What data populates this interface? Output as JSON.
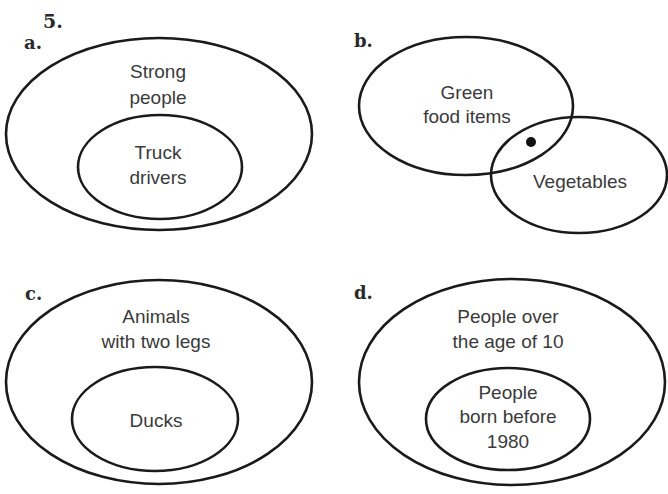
{
  "question": {
    "number": "5."
  },
  "colors": {
    "stroke": "#1a1a1a",
    "text": "#3a3a3a",
    "background": "#ffffff"
  },
  "diagrams": [
    {
      "label": "a.",
      "type": "subset",
      "outer": {
        "lines": [
          "Strong",
          "people"
        ]
      },
      "inner": {
        "lines": [
          "Truck",
          "drivers"
        ]
      }
    },
    {
      "label": "b.",
      "type": "overlap",
      "left": {
        "lines": [
          "Green",
          "food items"
        ]
      },
      "right": {
        "lines": [
          "Vegetables"
        ]
      },
      "marker": "dot-in-intersection"
    },
    {
      "label": "c.",
      "type": "subset",
      "outer": {
        "lines": [
          "Animals",
          "with two legs"
        ]
      },
      "inner": {
        "lines": [
          "Ducks"
        ]
      }
    },
    {
      "label": "d.",
      "type": "subset",
      "outer": {
        "lines": [
          "People over",
          "the age of 10"
        ]
      },
      "inner": {
        "lines": [
          "People",
          "born before",
          "1980"
        ]
      }
    }
  ]
}
